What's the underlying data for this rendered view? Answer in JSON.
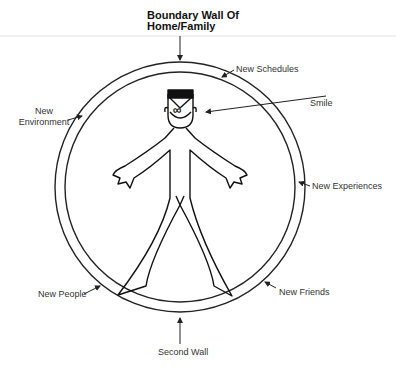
{
  "diagram": {
    "title_line1": "Boundary Wall Of",
    "title_line2": "Home/Family",
    "labels": {
      "new_schedules": "New Schedules",
      "smile": "Smile",
      "new_environment_line1": "New",
      "new_environment_line2": "Environment",
      "new_experiences": "New Experiences",
      "new_people": "New People",
      "new_friends": "New Friends",
      "second_wall": "Second Wall"
    },
    "face_symbol": "∞",
    "colors": {
      "line": "#222222",
      "text": "#333333",
      "background": "#ffffff",
      "rule": "#dddddd"
    }
  }
}
